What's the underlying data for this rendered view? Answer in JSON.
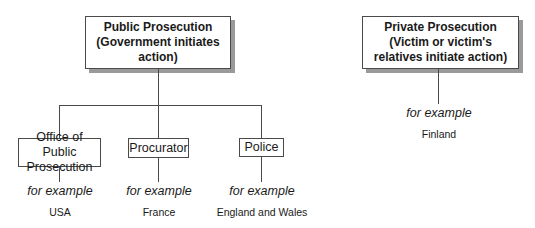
{
  "public": {
    "title": "Public Prosecution",
    "subtitle": "(Government initiates action)"
  },
  "private": {
    "title": "Private Prosecution",
    "subtitle": "(Victim or victim's relatives initiate action)",
    "example_label": "for example",
    "example": "Finland"
  },
  "branches": [
    {
      "label": "Office of Public Prosecution",
      "example_label": "for example",
      "example": "USA"
    },
    {
      "label": "Procurator",
      "example_label": "for example",
      "example": "France"
    },
    {
      "label": "Police",
      "example_label": "for example",
      "example": "England and Wales"
    }
  ]
}
